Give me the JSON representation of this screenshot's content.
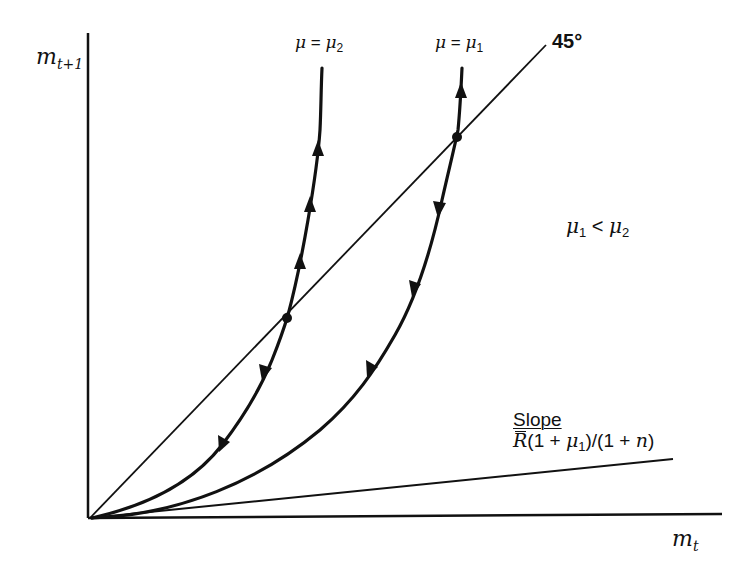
{
  "diagram": {
    "type": "phase-diagram",
    "axes": {
      "y_label": {
        "base": "m",
        "sub": "t+1"
      },
      "x_label": {
        "base": "m",
        "sub": "t"
      },
      "origin_px": [
        93,
        518
      ]
    },
    "reference_line": {
      "label": "45°",
      "from_px": [
        93,
        518
      ],
      "to_px": [
        545,
        45
      ]
    },
    "curves": [
      {
        "id": "mu2",
        "label_lhs": "μ",
        "label_eq": "=",
        "label_rhs_base": "μ",
        "label_rhs_sub": "2",
        "fixed_point_px": [
          287,
          318
        ],
        "arrows": [
          {
            "at_px": [
              318,
              150
            ],
            "direction": "up"
          },
          {
            "at_px": [
              311,
              205
            ],
            "direction": "up"
          },
          {
            "at_px": [
              300,
              262
            ],
            "direction": "up"
          },
          {
            "at_px": [
              266,
              372
            ],
            "direction": "down"
          },
          {
            "at_px": [
              224,
              443
            ],
            "direction": "down"
          }
        ]
      },
      {
        "id": "mu1",
        "label_lhs": "μ",
        "label_eq": "=",
        "label_rhs_base": "μ",
        "label_rhs_sub": "1",
        "fixed_point_px": [
          457,
          137
        ],
        "arrows": [
          {
            "at_px": [
              461,
              92
            ],
            "direction": "up"
          },
          {
            "at_px": [
              440,
              207
            ],
            "direction": "down"
          },
          {
            "at_px": [
              416,
              290
            ],
            "direction": "down"
          },
          {
            "at_px": [
              370,
              372
            ],
            "direction": "down"
          }
        ]
      }
    ],
    "slope_line": {
      "title": "Slope",
      "formula_rbar": "R",
      "formula_part1": "(1 + ",
      "formula_mu": "μ",
      "formula_mu_sub": "1",
      "formula_part2": ")/(1 + ",
      "formula_n": "n",
      "formula_part3": ")",
      "from_px": [
        93,
        518
      ],
      "to_px": [
        673,
        459
      ]
    },
    "condition": {
      "lhs_base": "μ",
      "lhs_sub": "1",
      "op": " < ",
      "rhs_base": "μ",
      "rhs_sub": "2"
    },
    "colors": {
      "ink": "#111111",
      "background": "#ffffff"
    }
  }
}
